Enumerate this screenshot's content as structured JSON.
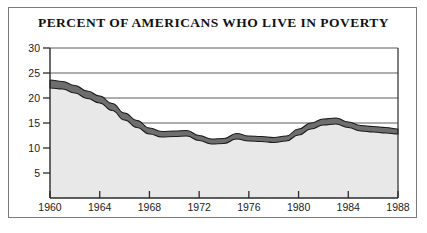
{
  "figure": {
    "title": "PERCENT OF AMERICANS WHO LIVE IN POVERTY",
    "frame_color": "#7b7b7b",
    "background_color": "#ffffff"
  },
  "chart_data": {
    "type": "area",
    "title": "PERCENT OF AMERICANS WHO LIVE IN POVERTY",
    "xlabel": "",
    "ylabel": "",
    "xlim": [
      1960,
      1988
    ],
    "ylim": [
      0,
      30
    ],
    "grid": true,
    "grid_axis": "y",
    "legend": false,
    "band_fill_color": "#6e6e6e",
    "area_fill_color": "#e8e8e8",
    "line_color": "#1b1b1b",
    "xticks": [
      1960,
      1964,
      1968,
      1972,
      1976,
      1980,
      1984,
      1988
    ],
    "xtick_labels": [
      "1960",
      "1964",
      "1968",
      "1972",
      "1976",
      "1980",
      "1984",
      "1988"
    ],
    "yticks": [
      5,
      10,
      15,
      20,
      25,
      30
    ],
    "ytick_labels": [
      "5",
      "10",
      "15",
      "20",
      "25",
      "30"
    ],
    "x": [
      1960,
      1961,
      1962,
      1963,
      1964,
      1965,
      1966,
      1967,
      1968,
      1969,
      1970,
      1971,
      1972,
      1973,
      1974,
      1975,
      1976,
      1977,
      1978,
      1979,
      1980,
      1981,
      1982,
      1983,
      1984,
      1985,
      1986,
      1987,
      1988
    ],
    "series": [
      {
        "name": "Percent in poverty (upper edge of band)",
        "values": [
          23.6,
          23.3,
          22.5,
          21.4,
          20.4,
          18.9,
          17.0,
          15.5,
          14.0,
          13.3,
          13.4,
          13.5,
          12.5,
          11.8,
          11.9,
          12.9,
          12.4,
          12.3,
          12.1,
          12.4,
          13.8,
          15.0,
          15.8,
          16.0,
          15.2,
          14.5,
          14.3,
          14.1,
          13.8
        ]
      },
      {
        "name": "Percent in poverty (lower edge of band)",
        "values": [
          22.0,
          21.8,
          21.0,
          19.9,
          19.0,
          17.5,
          15.6,
          14.1,
          12.8,
          12.2,
          12.3,
          12.4,
          11.5,
          10.8,
          10.9,
          11.8,
          11.4,
          11.3,
          11.1,
          11.4,
          12.6,
          13.8,
          14.6,
          14.8,
          14.1,
          13.4,
          13.2,
          13.0,
          12.8
        ]
      }
    ],
    "values": [
      22.8,
      22.5,
      21.7,
      20.6,
      19.7,
      18.2,
      16.3,
      14.8,
      13.4,
      12.7,
      12.8,
      12.9,
      12.0,
      11.3,
      11.4,
      12.3,
      11.9,
      11.8,
      11.6,
      11.9,
      13.2,
      14.4,
      15.2,
      15.4,
      14.6,
      13.9,
      13.7,
      13.5,
      13.3
    ]
  }
}
